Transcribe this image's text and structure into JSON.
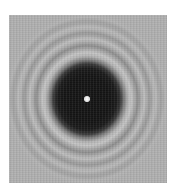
{
  "image": {
    "subject": "diffraction pattern",
    "description": "Dark circular shadow with a bright central spot surrounded by concentric light and dark fringes",
    "elements": {
      "central_spot": "bright point",
      "shadow_disc": "dark circular region",
      "fringes": "concentric rings"
    }
  }
}
